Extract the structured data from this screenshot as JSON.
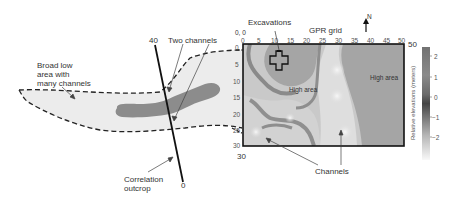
{
  "figure": {
    "left_panel": {
      "label_broad_low": [
        "Broad low",
        "area with",
        "many channels"
      ],
      "label_two_channels": "Two channels",
      "label_correlation": [
        "Correlation",
        "outcrop"
      ],
      "correlation_line": {
        "top_label": "40",
        "bottom_label": "0"
      },
      "colors": {
        "low_area_fill": "#ebebeb",
        "channel_fill": "#8c8c8c",
        "outline": "#222222"
      }
    },
    "gpr_panel": {
      "title": "GPR grid",
      "origin_label": "0, 0",
      "excavations_label": "Excavations",
      "north_label": "N",
      "x_ticks": [
        "0",
        "5",
        "10",
        "15",
        "20",
        "25",
        "30",
        "35",
        "40",
        "45",
        "50"
      ],
      "y_ticks": [
        "0",
        "5",
        "10",
        "15",
        "20",
        "25",
        "30"
      ],
      "corner_label_right": "50",
      "corner_label_bottom": "30",
      "high_area_left": "High area",
      "high_area_right": "High area",
      "channels_label": "Channels"
    },
    "colorbar": {
      "title": "Relative elevations (meters)",
      "ticks": [
        "2",
        "1",
        "0",
        "−1",
        "−2"
      ],
      "colors": {
        "top": "#6e6e6e",
        "mid_dark": "#4a4a4a",
        "bottom": "#f5f5f5"
      }
    }
  }
}
